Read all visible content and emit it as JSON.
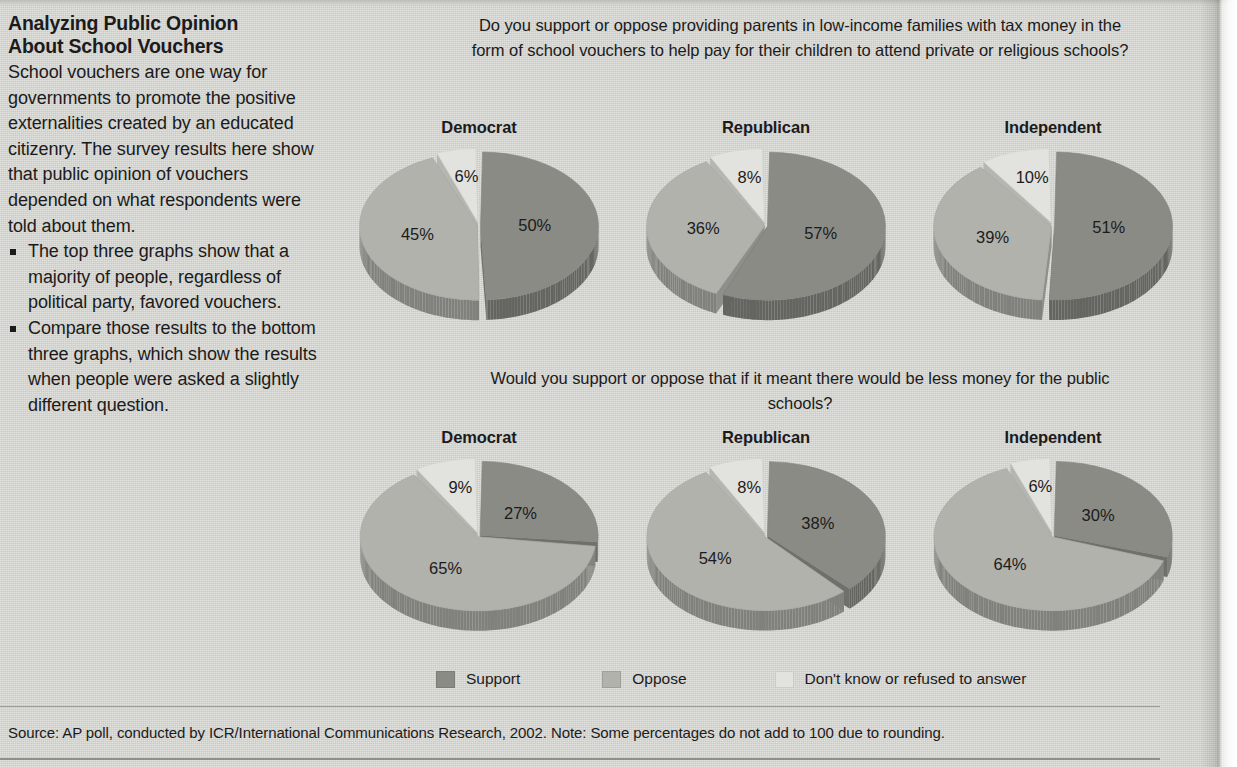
{
  "colors": {
    "page_background": "#d6d6d2",
    "support": "#8b8b86",
    "oppose": "#b2b2ad",
    "dont_know": "#e2e2de",
    "text": "#1b1b1b"
  },
  "sidebar": {
    "title_line_1": "Analyzing Public Opinion",
    "title_line_2": "About School Vouchers",
    "intro": "School vouchers are one way for governments to promote the positive externalities created by an educated citizenry. The survey results here show that public opinion of vouchers depended on what respondents were told about them.",
    "bullets": [
      "The top three graphs show that a majority of people, regardless of political party, favored vouchers.",
      "Compare those results to the bottom three graphs, which show the results when people were asked a slightly different question."
    ]
  },
  "legend": {
    "items": [
      {
        "label": "Support",
        "color": "#8b8b86"
      },
      {
        "label": "Oppose",
        "color": "#b2b2ad"
      },
      {
        "label": "Don't know or refused to answer",
        "color": "#e2e2de"
      }
    ]
  },
  "source": "Source: AP poll, conducted by ICR/International Communications Research, 2002.  Note: Some percentages do not add to 100 due to rounding.",
  "chart_data": [
    {
      "type": "pie",
      "title": "Do you support or oppose providing parents in low-income families with tax money in the form of school vouchers to help pay for their children to attend private or religious schools?",
      "legend_position": "bottom",
      "charts": [
        {
          "title": "Democrat",
          "categories": [
            "Support",
            "Oppose",
            "Don't know or refused to answer"
          ],
          "values": [
            50,
            45,
            6
          ],
          "labels": [
            "50%",
            "45%",
            "6%"
          ]
        },
        {
          "title": "Republican",
          "categories": [
            "Support",
            "Oppose",
            "Don't know or refused to answer"
          ],
          "values": [
            57,
            36,
            8
          ],
          "labels": [
            "57%",
            "36%",
            "8%"
          ]
        },
        {
          "title": "Independent",
          "categories": [
            "Support",
            "Oppose",
            "Don't know or refused to answer"
          ],
          "values": [
            51,
            39,
            10
          ],
          "labels": [
            "51%",
            "39%",
            "10%"
          ]
        }
      ]
    },
    {
      "type": "pie",
      "title": "Would you support or oppose that if it meant there would be less money for the public schools?",
      "legend_position": "bottom",
      "charts": [
        {
          "title": "Democrat",
          "categories": [
            "Support",
            "Oppose",
            "Don't know or refused to answer"
          ],
          "values": [
            27,
            65,
            9
          ],
          "labels": [
            "27%",
            "65%",
            "9%"
          ]
        },
        {
          "title": "Republican",
          "categories": [
            "Support",
            "Oppose",
            "Don't know or refused to answer"
          ],
          "values": [
            38,
            54,
            8
          ],
          "labels": [
            "38%",
            "54%",
            "8%"
          ]
        },
        {
          "title": "Independent",
          "categories": [
            "Support",
            "Oppose",
            "Don't know or refused to answer"
          ],
          "values": [
            30,
            64,
            6
          ],
          "labels": [
            "30%",
            "64%",
            "6%"
          ]
        }
      ]
    }
  ]
}
